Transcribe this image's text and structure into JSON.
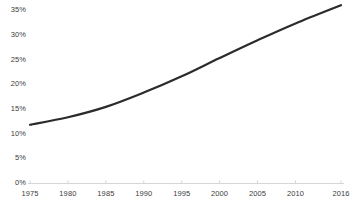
{
  "chart_data": {
    "type": "line",
    "title": "",
    "subtitle": "",
    "xlabel": "",
    "ylabel": "",
    "x": [
      1975,
      1980,
      1985,
      1990,
      1995,
      2000,
      2005,
      2010,
      2016
    ],
    "series": [
      {
        "name": "",
        "values": [
          11.8,
          13.3,
          15.4,
          18.3,
          21.6,
          25.3,
          28.9,
          32.3,
          36.0
        ]
      }
    ],
    "xlim": [
      1975,
      2016
    ],
    "ylim": [
      0,
      36.5
    ],
    "x_tick_labels": [
      "1975",
      "1980",
      "1985",
      "1990",
      "1995",
      "2000",
      "2005",
      "2010",
      "2016"
    ],
    "x_tick_values": [
      1975,
      1980,
      1985,
      1990,
      1995,
      2000,
      2005,
      2010,
      2016
    ],
    "y_tick_labels": [
      "0%",
      "5%",
      "10%",
      "15%",
      "20%",
      "25%",
      "30%",
      "35%"
    ],
    "y_tick_values": [
      0,
      5,
      10,
      15,
      20,
      25,
      30,
      35
    ],
    "grid": false,
    "legend": false,
    "legend_position": "none",
    "annotations": [],
    "series_color": "#2b2b2b",
    "axis_color": "#d6d6d6",
    "tick_label_color": "#3c3c3c",
    "background_color": "#ffffff",
    "line_width": 2.2
  }
}
